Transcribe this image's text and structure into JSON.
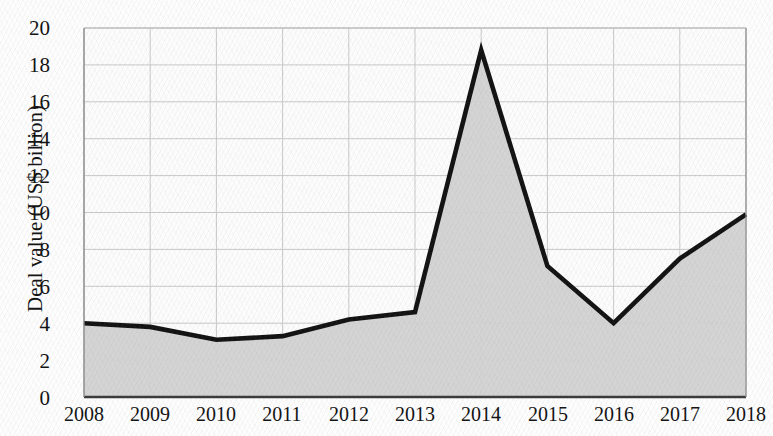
{
  "chart_data": {
    "type": "area",
    "title": "",
    "xlabel": "",
    "ylabel": "Deal value (US$ billion)",
    "categories": [
      "2008",
      "2009",
      "2010",
      "2011",
      "2012",
      "2013",
      "2014",
      "2015",
      "2016",
      "2017",
      "2018"
    ],
    "values": [
      4.0,
      3.8,
      3.1,
      3.3,
      4.2,
      4.6,
      18.8,
      7.1,
      4.0,
      7.5,
      9.9
    ],
    "series": [
      {
        "name": "Deal value",
        "values": [
          4.0,
          3.8,
          3.1,
          3.3,
          4.2,
          4.6,
          18.8,
          7.1,
          4.0,
          7.5,
          9.9
        ]
      }
    ],
    "ylim": [
      0,
      20
    ],
    "ytick_step": 2,
    "ytick_labels": [
      "20",
      "18",
      "16",
      "14",
      "12",
      "10",
      "8",
      "6",
      "4",
      "2",
      "0"
    ],
    "grid": true,
    "legend": "none",
    "colors": {
      "line": "#121212",
      "fill": "#d2d2d2",
      "gridline": "#c9c9c9",
      "axis": "#555555",
      "text": "#121212",
      "plot_background": "#fcfcfc"
    }
  },
  "axes": {
    "y_label": "Deal value (US$ billion)",
    "y_ticks": [
      {
        "label": "20",
        "value": 20
      },
      {
        "label": "18",
        "value": 18
      },
      {
        "label": "16",
        "value": 16
      },
      {
        "label": "14",
        "value": 14
      },
      {
        "label": "12",
        "value": 12
      },
      {
        "label": "10",
        "value": 10
      },
      {
        "label": "8",
        "value": 8
      },
      {
        "label": "6",
        "value": 6
      },
      {
        "label": "4",
        "value": 4
      },
      {
        "label": "2",
        "value": 2
      },
      {
        "label": "0",
        "value": 0
      }
    ],
    "x_ticks": [
      {
        "label": "2008"
      },
      {
        "label": "2009"
      },
      {
        "label": "2010"
      },
      {
        "label": "2011"
      },
      {
        "label": "2012"
      },
      {
        "label": "2013"
      },
      {
        "label": "2014"
      },
      {
        "label": "2015"
      },
      {
        "label": "2016"
      },
      {
        "label": "2017"
      },
      {
        "label": "2018"
      }
    ]
  },
  "title_fragment": ""
}
